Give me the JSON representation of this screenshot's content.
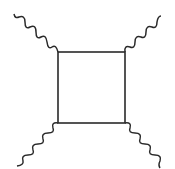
{
  "diagram": {
    "type": "feynman-box-diagram",
    "colors": {
      "line": "#2a2a2a",
      "background": "#ffffff"
    },
    "box": {
      "x": 58,
      "y": 52,
      "width": 67,
      "height": 71
    },
    "external_lines": [
      {
        "name": "top-left",
        "from": [
          58,
          52
        ],
        "to": [
          20,
          14
        ]
      },
      {
        "name": "top-right",
        "from": [
          125,
          52
        ],
        "to": [
          158,
          14
        ]
      },
      {
        "name": "bottom-left",
        "from": [
          58,
          123
        ],
        "to": [
          17,
          163
        ]
      },
      {
        "name": "bottom-right",
        "from": [
          125,
          123
        ],
        "to": [
          165,
          163
        ]
      }
    ]
  }
}
